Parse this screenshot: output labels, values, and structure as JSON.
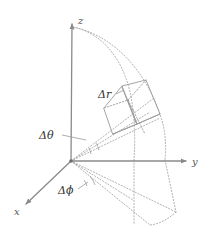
{
  "figure": {
    "background_color": "#ffffff",
    "width": 209,
    "height": 233
  },
  "colors": {
    "axis": "#8a8a8a",
    "solid_edge": "#9a9a9a",
    "dotted_guide": "#a8a8a8",
    "label_text": "#444444",
    "axis_label_text": "#555555"
  },
  "axes": [
    {
      "name": "z",
      "label": "z",
      "direction": "up",
      "origin": [
        71,
        161
      ],
      "tip": [
        72,
        22
      ]
    },
    {
      "name": "y",
      "label": "y",
      "direction": "right",
      "origin": [
        71,
        161
      ],
      "tip": [
        188,
        161
      ]
    },
    {
      "name": "x",
      "label": "x",
      "direction": "down-left",
      "origin": [
        71,
        161
      ],
      "tip": [
        24,
        206
      ]
    }
  ],
  "labels": {
    "z_axis": "z",
    "y_axis": "y",
    "x_axis": "x",
    "delta_r": "Δr",
    "delta_theta": "Δθ",
    "delta_phi": "Δϕ"
  },
  "annotations": [
    {
      "name": "delta-r-label",
      "text": "Δr",
      "x": 99,
      "y": 97,
      "leader": true
    },
    {
      "name": "delta-theta-label",
      "text": "Δθ",
      "x": 40,
      "y": 139,
      "leader": true
    },
    {
      "name": "delta-phi-label",
      "text": "Δϕ",
      "x": 60,
      "y": 194,
      "leader": true
    }
  ],
  "elements": {
    "arcs_count": 2,
    "arc_inner_label": "inner radial arc",
    "arc_outer_label": "outer radial arc",
    "volume_element_label": "volume element box",
    "projection_label": "xy-plane projection wedge",
    "theta_arc_label": "delta-theta angle arc",
    "phi_arc_label": "delta-phi angle arc"
  }
}
